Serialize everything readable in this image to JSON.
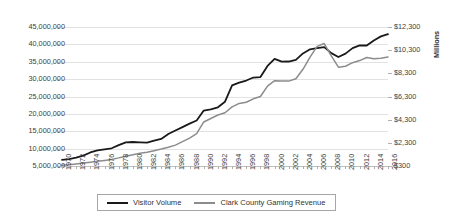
{
  "chart_data": {
    "type": "line",
    "title": "",
    "xlabel": "",
    "ylabel": "",
    "grid": true,
    "legend_position": "bottom",
    "x": [
      1970,
      1971,
      1972,
      1973,
      1974,
      1975,
      1976,
      1977,
      1978,
      1979,
      1980,
      1981,
      1982,
      1983,
      1984,
      1985,
      1986,
      1987,
      1988,
      1989,
      1990,
      1991,
      1992,
      1993,
      1994,
      1995,
      1996,
      1997,
      1998,
      1999,
      2000,
      2001,
      2002,
      2003,
      2004,
      2005,
      2006,
      2007,
      2008,
      2009,
      2010,
      2011,
      2012,
      2013,
      2014,
      2015,
      2016
    ],
    "x_tick_labels": [
      "1970",
      "1972",
      "1974",
      "1976",
      "1978",
      "1980",
      "1982",
      "1984",
      "1986",
      "1988",
      "1990",
      "1992",
      "1994",
      "1996",
      "1998",
      "2000",
      "2002",
      "2004",
      "2006",
      "2008",
      "2010",
      "2012",
      "2014",
      "2016"
    ],
    "axes": {
      "left": {
        "label": "",
        "ylim": [
          5000000,
          45000000
        ],
        "ticks": [
          5000000,
          10000000,
          15000000,
          20000000,
          25000000,
          30000000,
          35000000,
          40000000,
          45000000
        ],
        "tick_labels": [
          "5,000,000",
          "10,000,000",
          "15,000,000",
          "20,000,000",
          "25,000,000",
          "30,000,000",
          "35,000,000",
          "40,000,000",
          "45,000,000"
        ]
      },
      "right": {
        "label": "Millions",
        "ylim": [
          300,
          12300
        ],
        "ticks": [
          300,
          2300,
          4300,
          6300,
          8300,
          10300,
          12300
        ],
        "tick_labels": [
          "$300",
          "$2,300",
          "$4,300",
          "$6,300",
          "$8,300",
          "$10,300",
          "$12,300"
        ]
      }
    },
    "series": [
      {
        "name": "Visitor Volume",
        "axis": "left",
        "color": "#1a1a1a",
        "values": [
          6787650,
          7000000,
          7400000,
          8000000,
          8900000,
          9500000,
          9800000,
          10100000,
          11000000,
          11800000,
          11900000,
          11800000,
          11700000,
          12300000,
          12800000,
          14200000,
          15200000,
          16200000,
          17200000,
          18100000,
          20950000,
          21300000,
          21900000,
          23500000,
          28200000,
          29000000,
          29600000,
          30460000,
          30600000,
          33800000,
          35850000,
          35020000,
          35070000,
          35540000,
          37390000,
          38570000,
          38910000,
          39200000,
          37480000,
          36350000,
          37340000,
          38930000,
          39730000,
          39670000,
          41130000,
          42310000,
          42940000
        ]
      },
      {
        "name": "Clark County Gaming Revenue",
        "axis": "right",
        "color": "#8c8c8c",
        "values": [
          369,
          400,
          480,
          560,
          630,
          700,
          780,
          870,
          1000,
          1150,
          1280,
          1400,
          1490,
          1620,
          1760,
          1920,
          2100,
          2400,
          2700,
          3100,
          4100,
          4400,
          4700,
          4900,
          5400,
          5700,
          5800,
          6100,
          6300,
          7200,
          7670,
          7630,
          7630,
          7830,
          8650,
          9700,
          10630,
          10870,
          9800,
          8830,
          8910,
          9220,
          9400,
          9670,
          9550,
          9610,
          9710
        ]
      }
    ],
    "annotations": []
  },
  "legend": {
    "items": [
      {
        "label": "Visitor Volume",
        "color": "#1a1a1a"
      },
      {
        "label": "Clark County Gaming Revenue",
        "color": "#8c8c8c"
      }
    ]
  }
}
